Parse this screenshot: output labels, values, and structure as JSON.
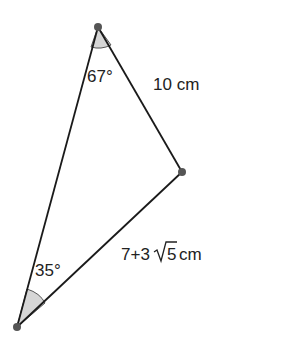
{
  "diagram": {
    "type": "triangle",
    "vertices": {
      "top": {
        "x": 98,
        "y": 27
      },
      "right": {
        "x": 182,
        "y": 172
      },
      "bottom_left": {
        "x": 17,
        "y": 327
      }
    },
    "colors": {
      "line": "#1a1a1a",
      "vertex": "#555555",
      "angle_fill": "#d6d6d6",
      "text": "#222222"
    },
    "labels": {
      "top_angle": "67°",
      "bottom_angle": "35°",
      "top_right_side": "10 cm",
      "bottom_side_prefix": "7+3",
      "bottom_side_radicand": "5",
      "bottom_side_unit": "cm"
    }
  }
}
